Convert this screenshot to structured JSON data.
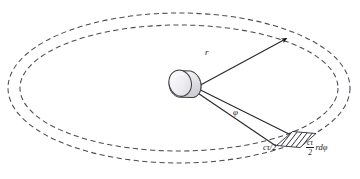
{
  "figure": {
    "background_color": "#ffffff",
    "width": 360,
    "height": 179
  },
  "labels": {
    "range_vector": "r",
    "azimuth_angle": "φ",
    "range_resolution": "cτ/2",
    "cell_numerator": "cτ",
    "cell_denominator": "2",
    "cell_arc_term": "rdφ"
  },
  "elements": {
    "outer_ellipse": {
      "name": "outer-range-ring",
      "stroke": "#4a4a55",
      "style": "dashed",
      "cx": 179,
      "cy": 88,
      "rx": 171,
      "ry": 75
    },
    "inner_ellipse": {
      "name": "inner-range-ring",
      "stroke": "#4a4a55",
      "style": "dashed",
      "cx": 179,
      "cy": 88,
      "rx": 159,
      "ry": 63
    },
    "radar_antenna": {
      "name": "radar-antenna-cylinder",
      "fill": "#e8e8ea",
      "stroke": "#3a3a40",
      "x": 168,
      "y": 68,
      "width": 34,
      "height": 30
    },
    "resolution_cell": {
      "name": "resolution-cell-patch",
      "fill": "#ffffff",
      "hatch": "diagonal",
      "stroke": "#2a2a2a"
    },
    "range_ray": {
      "name": "range-vector-ray",
      "stroke": "#2a2a2a",
      "arrowhead": true,
      "from": [
        200,
        86
      ],
      "to": [
        288,
        38
      ]
    },
    "sector_rays": {
      "name": "azimuth-sector-rays",
      "stroke": "#2a2a2a",
      "from": [
        198,
        91
      ],
      "to_upper": [
        290,
        137
      ],
      "to_lower": [
        277,
        145
      ]
    }
  }
}
